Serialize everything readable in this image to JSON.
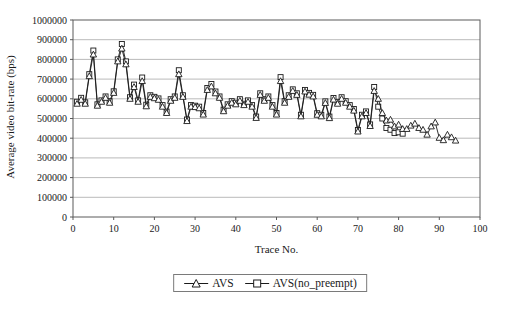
{
  "figure": {
    "background": "#ffffff",
    "line_color": "#1a1a1a",
    "grid_color": "#a8a8a8",
    "frame_color": "#5a5a5a",
    "marker_fill": "#ffffff"
  },
  "legend": {
    "items": [
      {
        "label": "AVS",
        "marker": "triangle"
      },
      {
        "label": "AVS(no_preempt)",
        "marker": "square"
      }
    ]
  },
  "chart_data": {
    "type": "line",
    "title": "",
    "xlabel": "Trace No.",
    "ylabel": "Average video bit-rate (bps)",
    "xlim": [
      0,
      100
    ],
    "ylim": [
      0,
      1000000
    ],
    "xticks": [
      0,
      10,
      20,
      30,
      40,
      50,
      60,
      70,
      80,
      90,
      100
    ],
    "xtick_labels": [
      "0",
      "10",
      "20",
      "30",
      "40",
      "50",
      "60",
      "70",
      "80",
      "90",
      "100"
    ],
    "yticks": [
      0,
      100000,
      200000,
      300000,
      400000,
      500000,
      600000,
      700000,
      800000,
      900000,
      1000000
    ],
    "ytick_labels": [
      "0",
      "100000",
      "200000",
      "300000",
      "400000",
      "500000",
      "600000",
      "700000",
      "800000",
      "900000",
      "1000000"
    ],
    "grid": "horizontal",
    "legend_position": "bottom-center",
    "series": [
      {
        "name": "AVS",
        "marker": "triangle",
        "color": "#1a1a1a",
        "x_start": 1,
        "x_step": 1,
        "values": [
          575000,
          595000,
          575000,
          715000,
          825000,
          565000,
          585000,
          605000,
          580000,
          630000,
          790000,
          855000,
          775000,
          600000,
          660000,
          585000,
          690000,
          562000,
          610000,
          603000,
          595000,
          560000,
          528000,
          590000,
          605000,
          725000,
          610000,
          487000,
          560000,
          558000,
          552000,
          520000,
          645000,
          663000,
          628000,
          605000,
          537000,
          565000,
          580000,
          572000,
          590000,
          568000,
          585000,
          560000,
          503000,
          620000,
          590000,
          605000,
          560000,
          520000,
          690000,
          580000,
          610000,
          640000,
          620000,
          511000,
          637000,
          621000,
          612000,
          519000,
          511000,
          579000,
          502000,
          596000,
          575000,
          600000,
          580000,
          560000,
          540000,
          434000,
          511000,
          528000,
          462000,
          640000,
          600000,
          528000,
          490000,
          494000,
          460000,
          469000,
          447000,
          447000,
          464000,
          474000,
          452000,
          443000,
          418000,
          460000,
          480000,
          402000,
          390000,
          418000,
          405000,
          388000
        ]
      },
      {
        "name": "AVS(no_preempt)",
        "marker": "square",
        "color": "#1a1a1a",
        "x_start": 1,
        "x_step": 1,
        "values": [
          585000,
          605000,
          582000,
          725000,
          845000,
          572000,
          592000,
          612000,
          588000,
          638000,
          800000,
          878000,
          790000,
          608000,
          672000,
          592000,
          708000,
          570000,
          618000,
          610000,
          602000,
          568000,
          535000,
          598000,
          612000,
          745000,
          618000,
          495000,
          568000,
          565000,
          560000,
          528000,
          655000,
          675000,
          637000,
          612000,
          545000,
          572000,
          588000,
          580000,
          598000,
          575000,
          592000,
          568000,
          510000,
          628000,
          598000,
          612000,
          568000,
          528000,
          710000,
          588000,
          618000,
          648000,
          628000,
          519000,
          645000,
          630000,
          620000,
          527000,
          519000,
          587000,
          510000,
          604000,
          583000,
          608000,
          588000,
          568000,
          548000,
          442000,
          519000,
          536000,
          470000,
          660000,
          560000,
          500000,
          452000,
          443000,
          426000,
          430000,
          423000
        ]
      }
    ]
  }
}
